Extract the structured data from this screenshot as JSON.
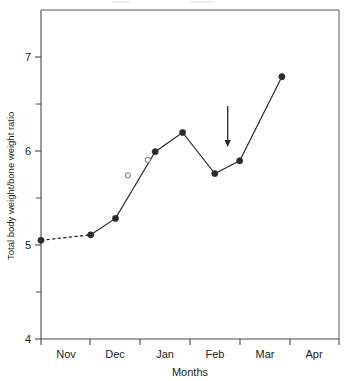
{
  "chart_data": {
    "type": "line",
    "title": "",
    "xlabel": "Months",
    "ylabel": "Total body weight/bone weight ratio",
    "xlim": [
      0,
      6
    ],
    "ylim": [
      4,
      7.6
    ],
    "yticks": [
      4,
      5,
      6,
      7
    ],
    "ytick_labels": [
      "4",
      "5",
      "6",
      "7"
    ],
    "yticks_minor": [
      4.5,
      5.5,
      6.5
    ],
    "xtick_positions": [
      0,
      1,
      2,
      3,
      4,
      5,
      6
    ],
    "categories": [
      "Nov",
      "Dec",
      "Jan",
      "Feb",
      "Mar",
      "Apr"
    ],
    "grid": false,
    "legend": "none",
    "series": [
      {
        "name": "Total body weight/bone weight ratio",
        "marker": "filled-circle",
        "x": [
          0.0,
          1.0,
          1.5,
          2.3,
          2.85,
          3.5,
          4.0,
          4.85
        ],
        "values": [
          5.08,
          5.14,
          5.32,
          6.05,
          6.26,
          5.81,
          5.95,
          6.87
        ],
        "segments": [
          {
            "style": "dashed",
            "from": 0,
            "to": 1
          },
          {
            "style": "solid",
            "from": 1,
            "to": 7
          }
        ]
      },
      {
        "name": "Open circle observations",
        "marker": "open-circle",
        "line": "none",
        "x": [
          1.75,
          2.15
        ],
        "values": [
          5.79,
          5.96
        ]
      }
    ],
    "annotations": [
      {
        "type": "arrow",
        "name": "down-arrow-annotation",
        "x": 3.76,
        "y_start": 6.55,
        "y_end": 6.1,
        "direction": "down"
      }
    ]
  },
  "axes": {
    "y_title": "Total body weight/bone weight ratio",
    "x_title": "Months",
    "y_tick_7": "7",
    "y_tick_6": "6",
    "y_tick_5": "5",
    "y_tick_4": "4",
    "x_label_nov": "Nov",
    "x_label_dec": "Dec",
    "x_label_jan": "Jan",
    "x_label_feb": "Feb",
    "x_label_mar": "Mar",
    "x_label_apr": "Apr"
  },
  "colors": {
    "background": "#ffffff",
    "axis": "#4a4a4a",
    "frame": "#5a5a5a",
    "series": "#2b2b2b",
    "open_marker_stroke": "#5d5d5d",
    "text": "#1a1a1a"
  }
}
